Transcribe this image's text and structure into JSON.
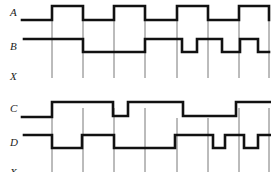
{
  "diagram": {
    "type": "timing-diagram",
    "panels": [
      {
        "signals": [
          {
            "label": "A",
            "levels": [
              0,
              1,
              0,
              1,
              0,
              1,
              0,
              1
            ],
            "edges_x": [
              22,
              52,
              83,
              114,
              145,
              177,
              208,
              239,
              269
            ]
          },
          {
            "label": "B",
            "transitions": "high to 83, low to 145, high to 182, low to 197, high to 222, low to 240, high to 258, low to 269"
          },
          {
            "label": "X",
            "levels": []
          }
        ]
      },
      {
        "signals": [
          {
            "label": "C",
            "transitions": "low to 52, high to 113, low to 128, high to 183, low to 236, high to 270"
          },
          {
            "label": "D",
            "transitions": "high to 52, low to 82, high to 114, low to 175, high to 213, low to 225, high to 244, low to 258, high to 270"
          },
          {
            "label": "X",
            "levels": []
          }
        ]
      }
    ],
    "clock_lines_x": [
      52,
      83,
      114,
      145,
      177,
      208,
      239,
      269
    ]
  },
  "labels": {
    "a": "A",
    "b": "B",
    "x1": "X",
    "c": "C",
    "d": "D",
    "x2": "X"
  }
}
